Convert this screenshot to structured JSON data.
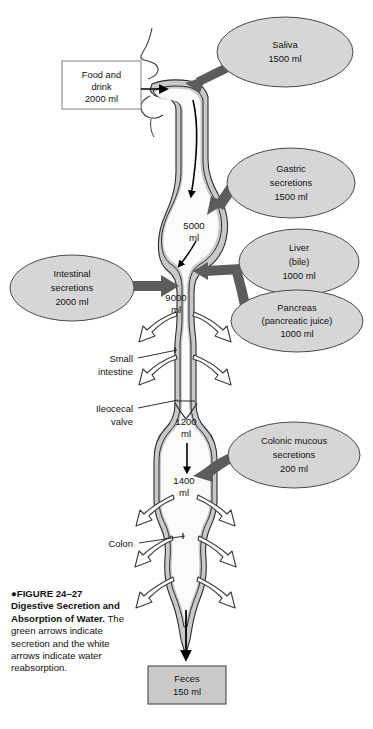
{
  "figure": {
    "number_line": "FIGURE 24–27",
    "title": "Digestive Secretion and Absorption of Water.",
    "caption_body": "The green arrows indicate secretion and the white arrows indicate water reabsorption.",
    "bullet_glyph": "●"
  },
  "colors": {
    "tract_fill": "#c9c9c9",
    "tract_stroke": "#2b2b2b",
    "lumen_fill": "#ffffff",
    "ellipse_fill": "#d6d6d6",
    "ellipse_stroke": "#4a4a4a",
    "secretion_arrow": "#5c5c5c",
    "absorption_arrow": "#ffffff",
    "absorption_stroke": "#3a3a3a",
    "input_box_fill": "#ffffff",
    "input_box_stroke": "#8a8a8a",
    "output_box_fill": "#c9c9c9",
    "output_box_stroke": "#4a4a4a",
    "flow_arrow": "#000000",
    "leader_line": "#1a1a1a",
    "text": "#111111"
  },
  "input_box": {
    "name": "Food and drink",
    "lines": [
      "Food and",
      "drink",
      "2000 ml"
    ],
    "volume_ml": 2000
  },
  "output_box": {
    "name": "Feces",
    "lines": [
      "Feces",
      "150 ml"
    ],
    "volume_ml": 150
  },
  "secretion_sources": [
    {
      "id": "saliva",
      "lines": [
        "Saliva",
        "1500 ml"
      ],
      "label": "Saliva",
      "volume_ml": 1500,
      "cx": 285,
      "cy": 52,
      "rx": 68,
      "ry": 35
    },
    {
      "id": "gastric",
      "lines": [
        "Gastric",
        "secretions",
        "1500 ml"
      ],
      "label": "Gastric secretions",
      "volume_ml": 1500,
      "cx": 291,
      "cy": 183,
      "rx": 64,
      "ry": 35
    },
    {
      "id": "liver-bile",
      "lines": [
        "Liver",
        "(bile)",
        "1000 ml"
      ],
      "label": "Liver (bile)",
      "volume_ml": 1000,
      "cx": 299,
      "cy": 262,
      "rx": 60,
      "ry": 33
    },
    {
      "id": "pancreas",
      "lines": [
        "Pancreas",
        "(pancreatic juice)",
        "1000 ml"
      ],
      "label": "Pancreas (pancreatic juice)",
      "volume_ml": 1000,
      "cx": 297,
      "cy": 321,
      "rx": 64,
      "ry": 31
    },
    {
      "id": "intestinal",
      "lines": [
        "Intestinal",
        "secretions",
        "2000 ml"
      ],
      "label": "Intestinal secretions",
      "volume_ml": 2000,
      "cx": 72,
      "cy": 288,
      "rx": 62,
      "ry": 33
    },
    {
      "id": "colonic-mucous",
      "lines": [
        "Colonic mucous",
        "secretions",
        "200 ml"
      ],
      "label": "Colonic mucous secretions",
      "volume_ml": 200,
      "cx": 294,
      "cy": 455,
      "rx": 66,
      "ry": 33
    }
  ],
  "volume_markers": [
    {
      "id": "stomach-volume",
      "lines": [
        "5000",
        "ml"
      ],
      "value_ml": 5000,
      "x": 194,
      "y": 229
    },
    {
      "id": "duodenum-volume",
      "lines": [
        "9000",
        "ml"
      ],
      "value_ml": 9000,
      "x": 176,
      "y": 301
    },
    {
      "id": "ileocecal-volume",
      "lines": [
        "1200",
        "ml"
      ],
      "value_ml": 1200,
      "x": 186,
      "y": 425
    },
    {
      "id": "colon-volume",
      "lines": [
        "1400",
        "ml"
      ],
      "value_ml": 1400,
      "x": 184,
      "y": 484
    }
  ],
  "anatomy_labels": [
    {
      "id": "small-intestine",
      "lines": [
        "Small",
        "intestine"
      ],
      "label": "Small intestine",
      "x": 133,
      "y": 362
    },
    {
      "id": "ileocecal-valve",
      "lines": [
        "Ileocecal",
        "valve"
      ],
      "label": "Ileocecal valve",
      "x": 133,
      "y": 412
    },
    {
      "id": "colon",
      "lines": [
        "Colon"
      ],
      "label": "Colon",
      "x": 133,
      "y": 547
    }
  ]
}
